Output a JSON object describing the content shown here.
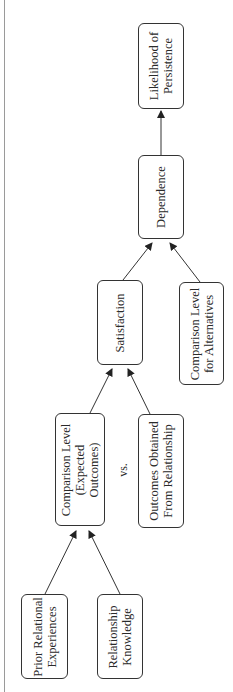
{
  "diagram": {
    "type": "flowchart",
    "orientation": "rotated-90-ccw",
    "nodes": {
      "prior_relational": {
        "label": "Prior Relational\nExperiences"
      },
      "relationship_knowledge": {
        "label": "Relationship\nKnowledge"
      },
      "comparison_level": {
        "label": "Comparison Level\n(Expected\nOutcomes)"
      },
      "outcomes_obtained": {
        "label": "Outcomes Obtained\nFrom Relationship"
      },
      "satisfaction": {
        "label": "Satisfaction"
      },
      "comparison_level_alternatives": {
        "label": "Comparison Level\nfor Alternatives"
      },
      "dependence": {
        "label": "Dependence"
      },
      "likelihood_persistence": {
        "label": "Likelihood of\nPersistence"
      }
    },
    "vs_label": "vs.",
    "edges": [
      {
        "from": "prior_relational",
        "to": "comparison_level"
      },
      {
        "from": "relationship_knowledge",
        "to": "comparison_level"
      },
      {
        "from": "comparison_level",
        "to": "satisfaction"
      },
      {
        "from": "outcomes_obtained",
        "to": "satisfaction"
      },
      {
        "from": "satisfaction",
        "to": "dependence"
      },
      {
        "from": "comparison_level_alternatives",
        "to": "dependence"
      },
      {
        "from": "dependence",
        "to": "likelihood_persistence"
      }
    ]
  }
}
